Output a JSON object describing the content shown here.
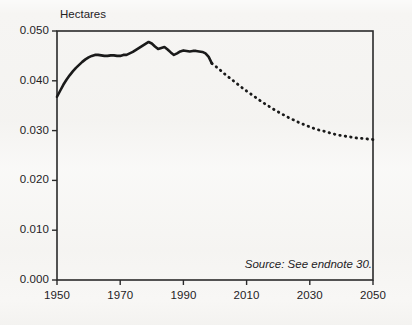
{
  "chart_data": {
    "type": "line",
    "title": "",
    "ylabel": "Hectares",
    "xlabel": "",
    "ylim": [
      0.0,
      0.05
    ],
    "xlim": [
      1950,
      2050
    ],
    "grid": false,
    "legend_position": "none",
    "yticks": [
      "0.000",
      "0.010",
      "0.020",
      "0.030",
      "0.040",
      "0.050"
    ],
    "ytick_values": [
      0.0,
      0.01,
      0.02,
      0.03,
      0.04,
      0.05
    ],
    "xticks": [
      "1950",
      "1970",
      "1990",
      "2010",
      "2030",
      "2050"
    ],
    "xtick_values": [
      1950,
      1970,
      1990,
      2010,
      2030,
      2050
    ],
    "annotations": [
      "Source:  See endnote 30."
    ],
    "series": [
      {
        "name": "historical",
        "style": "solid",
        "color": "#1a1a1a",
        "x": [
          1950,
          1951,
          1952,
          1953,
          1954,
          1955,
          1956,
          1957,
          1958,
          1959,
          1960,
          1961,
          1962,
          1963,
          1964,
          1965,
          1966,
          1967,
          1968,
          1969,
          1970,
          1971,
          1972,
          1973,
          1974,
          1975,
          1976,
          1977,
          1978,
          1979,
          1980,
          1981,
          1982,
          1983,
          1984,
          1985,
          1986,
          1987,
          1988,
          1989,
          1990,
          1991,
          1992,
          1993,
          1994,
          1995,
          1996,
          1997,
          1998,
          1999
        ],
        "values": [
          0.0368,
          0.038,
          0.0392,
          0.0402,
          0.0411,
          0.0419,
          0.0426,
          0.0432,
          0.0438,
          0.0443,
          0.0447,
          0.045,
          0.0452,
          0.0452,
          0.0451,
          0.045,
          0.045,
          0.0451,
          0.0451,
          0.045,
          0.045,
          0.0452,
          0.0452,
          0.0455,
          0.0458,
          0.0462,
          0.0466,
          0.047,
          0.0474,
          0.0478,
          0.0475,
          0.0469,
          0.0464,
          0.0466,
          0.0468,
          0.0463,
          0.0457,
          0.0452,
          0.0455,
          0.0459,
          0.0461,
          0.046,
          0.0459,
          0.046,
          0.046,
          0.0459,
          0.0458,
          0.0455,
          0.0448,
          0.0435
        ]
      },
      {
        "name": "projection",
        "style": "dotted",
        "color": "#1a1a1a",
        "x": [
          1999,
          2001,
          2003,
          2005,
          2007,
          2009,
          2011,
          2013,
          2015,
          2017,
          2019,
          2021,
          2023,
          2025,
          2027,
          2029,
          2031,
          2033,
          2035,
          2037,
          2039,
          2041,
          2043,
          2045,
          2047,
          2050
        ],
        "values": [
          0.0435,
          0.0425,
          0.0414,
          0.0404,
          0.0394,
          0.0384,
          0.0375,
          0.0366,
          0.0357,
          0.0349,
          0.0341,
          0.0334,
          0.0327,
          0.0321,
          0.0315,
          0.031,
          0.0305,
          0.0301,
          0.0298,
          0.0294,
          0.0291,
          0.0289,
          0.0287,
          0.0285,
          0.0284,
          0.0282
        ]
      }
    ],
    "axis_color": "#2a2a2a",
    "background_color": "#f6f5f3"
  }
}
